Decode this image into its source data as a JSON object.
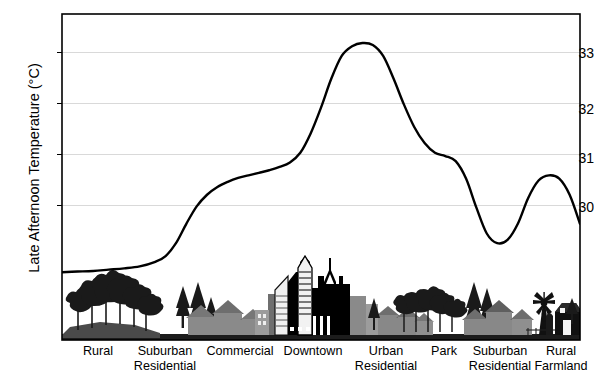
{
  "figure": {
    "width": 594,
    "height": 386,
    "background": "#ffffff",
    "frame_color": "#000000",
    "gridline_color": "#d9d9d9",
    "curve_color": "#000000"
  },
  "axis": {
    "y_title": "Late Afternoon Temperature (°C)",
    "y_ticks": [
      "30",
      "31",
      "32",
      "33"
    ],
    "y_tick_values": [
      30,
      31,
      32,
      33
    ],
    "y_unit": "°C"
  },
  "x_labels": [
    {
      "line1": "Rural",
      "line2": ""
    },
    {
      "line1": "Suburban",
      "line2": "Residential"
    },
    {
      "line1": "Commercial",
      "line2": ""
    },
    {
      "line1": "Downtown",
      "line2": ""
    },
    {
      "line1": "Urban",
      "line2": "Residential"
    },
    {
      "line1": "Park",
      "line2": ""
    },
    {
      "line1": "Suburban",
      "line2": "Residential"
    },
    {
      "line1": "Rural",
      "line2": "Farmland"
    }
  ],
  "chart_data": {
    "type": "line",
    "title": "",
    "subtitle": "",
    "xlabel": "",
    "ylabel": "Late Afternoon Temperature (°C)",
    "ylim": [
      28.55,
      33.6
    ],
    "xlim": [
      0,
      100
    ],
    "grid": true,
    "gridlines_y": [
      30,
      31,
      32,
      33
    ],
    "legend": "none",
    "x_categories": [
      "Rural",
      "Suburban Residential",
      "Commercial",
      "Downtown",
      "Urban Residential",
      "Park",
      "Suburban Residential",
      "Rural Farmland"
    ],
    "annotations": [
      {
        "label": "Rural baseline",
        "value": 29.6
      },
      {
        "label": "Suburban/Commercial plateau",
        "value": 31.1
      },
      {
        "label": "Downtown peak",
        "value": 33.15
      },
      {
        "label": "Urban residential shoulder",
        "value": 30.85
      },
      {
        "label": "Park minimum",
        "value": 30.05
      },
      {
        "label": "Suburban secondary peak",
        "value": 31.1
      },
      {
        "label": "Rural farmland baseline",
        "value": 29.55
      }
    ],
    "series": [
      {
        "name": "Late Afternoon Temperature",
        "x": [
          0,
          3,
          6,
          9,
          12,
          15,
          18,
          20,
          22,
          24,
          26,
          28,
          30,
          32,
          34,
          36,
          38,
          40,
          42,
          44,
          46,
          48,
          50,
          52,
          54,
          56,
          58,
          60,
          62,
          64,
          66,
          68,
          70,
          72,
          74,
          76,
          78,
          80,
          82,
          84,
          86,
          88,
          90,
          92,
          94,
          96,
          98,
          100
        ],
        "values": [
          29.6,
          29.61,
          29.62,
          29.64,
          29.66,
          29.69,
          29.76,
          29.85,
          30.05,
          30.35,
          30.62,
          30.8,
          30.92,
          31.0,
          31.06,
          31.1,
          31.14,
          31.18,
          31.23,
          31.3,
          31.45,
          31.75,
          32.15,
          32.6,
          32.95,
          33.1,
          33.15,
          33.12,
          32.95,
          32.6,
          32.2,
          31.85,
          31.6,
          31.45,
          31.4,
          31.32,
          31.05,
          30.6,
          30.2,
          30.05,
          30.1,
          30.35,
          30.75,
          31.02,
          31.1,
          31.05,
          30.8,
          30.35
        ]
      }
    ]
  },
  "skyline": {
    "description": "urban transect silhouette showing trees, suburban houses, commercial blocks, downtown skyscrapers, urban houses, park trees, suburban houses, windmill and barn",
    "items": [
      {
        "name": "rural-trees",
        "zone": "Rural"
      },
      {
        "name": "suburban-houses",
        "zone": "Suburban Residential"
      },
      {
        "name": "commercial-blocks",
        "zone": "Commercial"
      },
      {
        "name": "downtown-skyscrapers",
        "zone": "Downtown"
      },
      {
        "name": "urban-houses",
        "zone": "Urban Residential"
      },
      {
        "name": "park-trees",
        "zone": "Park"
      },
      {
        "name": "suburban-houses-2",
        "zone": "Suburban Residential"
      },
      {
        "name": "farm-windmill-barn",
        "zone": "Rural Farmland"
      }
    ]
  }
}
